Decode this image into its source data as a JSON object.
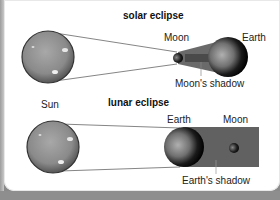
{
  "diagram": {
    "solar": {
      "title": "solar eclipse",
      "labels": {
        "moon": "Moon",
        "earth": "Earth",
        "shadow": "Moon's shadow"
      }
    },
    "lunar": {
      "title": "lunar eclipse",
      "labels": {
        "earth": "Earth",
        "moon": "Moon",
        "shadow": "Earth's shadow"
      }
    },
    "sun_label": "Sun",
    "colors": {
      "sun": "#8c8c8c",
      "shadow": "#5a5a5a",
      "background": "#ffffff",
      "frame": "#8a8a8a"
    }
  }
}
